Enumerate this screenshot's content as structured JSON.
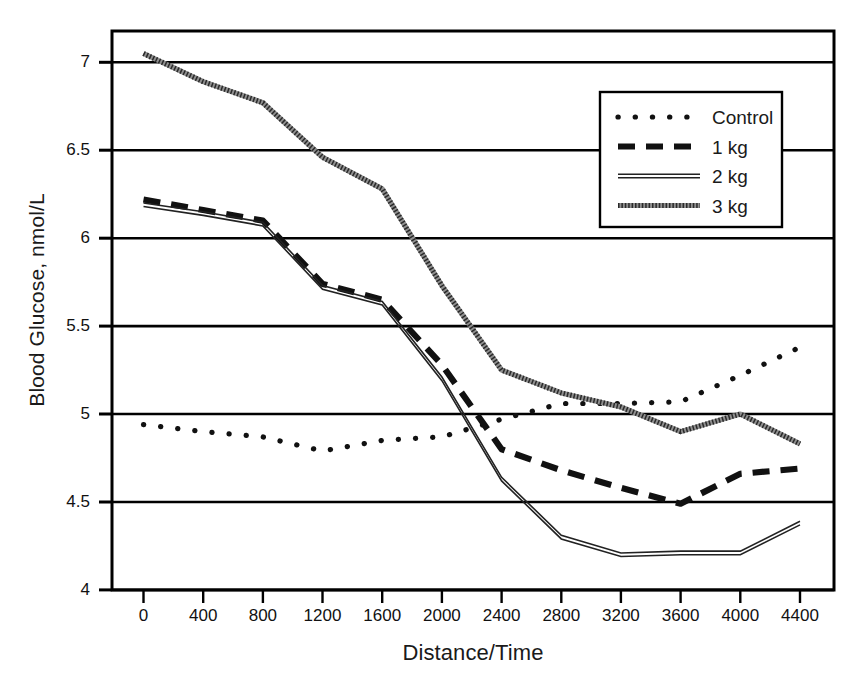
{
  "chart_data": {
    "type": "line",
    "title": "",
    "xlabel": "Distance/Time",
    "ylabel": "Blood Glucose, nmol/L",
    "xlim": [
      0,
      4400
    ],
    "ylim": [
      4,
      7.25
    ],
    "grid": "horizontal",
    "legend_position": "top-right",
    "xticks": [
      0,
      400,
      800,
      1200,
      1600,
      2000,
      2400,
      2800,
      3200,
      3600,
      4000,
      4400
    ],
    "xtick_labels": [
      "0",
      "400",
      "800",
      "1200",
      "1600",
      "2000",
      "2400",
      "2800",
      "3200",
      "3600",
      "4000",
      "4400"
    ],
    "yticks": [
      4,
      4.5,
      5,
      5.5,
      6,
      6.5,
      7
    ],
    "ytick_labels": [
      "4",
      "4.5",
      "5",
      "5.5",
      "6",
      "6.5",
      "7"
    ],
    "x": [
      0,
      400,
      800,
      1200,
      1600,
      2000,
      2400,
      2800,
      3200,
      3600,
      4000,
      4400
    ],
    "series": [
      {
        "name": "Control",
        "style": "dotted",
        "values": [
          4.94,
          4.9,
          4.87,
          4.79,
          4.85,
          4.87,
          4.97,
          5.06,
          5.06,
          5.07,
          5.22,
          5.38
        ]
      },
      {
        "name": "1 kg",
        "style": "dashed",
        "values": [
          6.22,
          6.16,
          6.1,
          5.74,
          5.65,
          5.28,
          4.8,
          4.68,
          4.58,
          4.49,
          4.66,
          4.69
        ]
      },
      {
        "name": "2 kg",
        "style": "double-thin",
        "values": [
          6.19,
          6.14,
          6.08,
          5.72,
          5.63,
          5.2,
          4.63,
          4.3,
          4.2,
          4.21,
          4.21,
          4.38
        ]
      },
      {
        "name": "3 kg",
        "style": "fine-dotted",
        "values": [
          7.05,
          6.89,
          6.77,
          6.46,
          6.28,
          5.73,
          5.25,
          5.12,
          5.04,
          4.9,
          5.0,
          4.83
        ]
      }
    ]
  },
  "legend": {
    "entries": [
      {
        "label": "Control",
        "style": "dotted"
      },
      {
        "label": "1 kg",
        "style": "dashed"
      },
      {
        "label": "2 kg",
        "style": "double-thin"
      },
      {
        "label": "3 kg",
        "style": "fine-dotted"
      }
    ]
  },
  "colors": {
    "line": "#111111",
    "grid": "#000000",
    "axis": "#000000",
    "background": "#ffffff",
    "light_line": "#8a8a8a"
  }
}
